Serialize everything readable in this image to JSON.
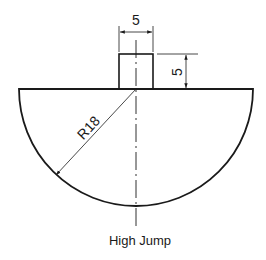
{
  "drawing": {
    "title": "High Jump",
    "dimensions": {
      "top_width": "5",
      "top_height": "5",
      "radius": "R18"
    },
    "colors": {
      "line": "#1a1a1a",
      "background": "#ffffff"
    }
  }
}
